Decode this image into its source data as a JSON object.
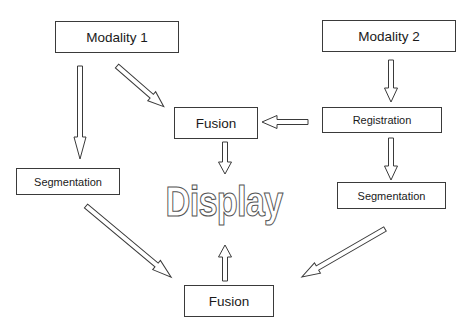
{
  "diagram": {
    "type": "flowchart",
    "nodes": {
      "modality1": {
        "label": "Modality 1"
      },
      "modality2": {
        "label": "Modality 2"
      },
      "fusion_top": {
        "label": "Fusion"
      },
      "registration": {
        "label": "Registration"
      },
      "segmentation_left": {
        "label": "Segmentation"
      },
      "segmentation_right": {
        "label": "Segmentation"
      },
      "display": {
        "label": "Display"
      },
      "fusion_bottom": {
        "label": "Fusion"
      }
    },
    "edges": [
      {
        "from": "Modality 1",
        "to": "Segmentation (left)"
      },
      {
        "from": "Modality 1",
        "to": "Fusion (top)"
      },
      {
        "from": "Modality 2",
        "to": "Registration"
      },
      {
        "from": "Registration",
        "to": "Fusion (top)"
      },
      {
        "from": "Registration",
        "to": "Segmentation (right)"
      },
      {
        "from": "Fusion (top)",
        "to": "Display"
      },
      {
        "from": "Segmentation (left)",
        "to": "Fusion (bottom)"
      },
      {
        "from": "Segmentation (right)",
        "to": "Fusion (bottom)"
      },
      {
        "from": "Fusion (bottom)",
        "to": "Display"
      }
    ],
    "colors": {
      "stroke": "#3a3a3a",
      "fill": "#ffffff",
      "text": "#1a1a1a",
      "display_outline": "#555555"
    }
  }
}
